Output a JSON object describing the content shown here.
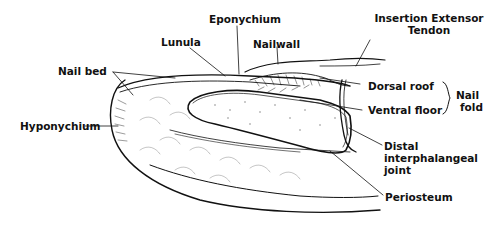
{
  "diagram": {
    "type": "anatomical cross-section",
    "labels": {
      "eponychium": "Eponychium",
      "insertion_line1": "Insertion Extensor",
      "insertion_line2": "Tendon",
      "lunula": "Lunula",
      "nailwall": "Nailwall",
      "nail_bed": "Nail bed",
      "dorsal_roof": "Dorsal roof",
      "ventral_floor": "Ventral floor",
      "nail_fold_line1": "Nail",
      "nail_fold_line2": "fold",
      "hyponychium": "Hyponychium",
      "distal_line1": "Distal",
      "distal_line2": "interphalangeal",
      "distal_line3": "joint",
      "periosteum": "Periosteum"
    },
    "colors": {
      "ink": "#111111",
      "background": "#ffffff"
    }
  }
}
